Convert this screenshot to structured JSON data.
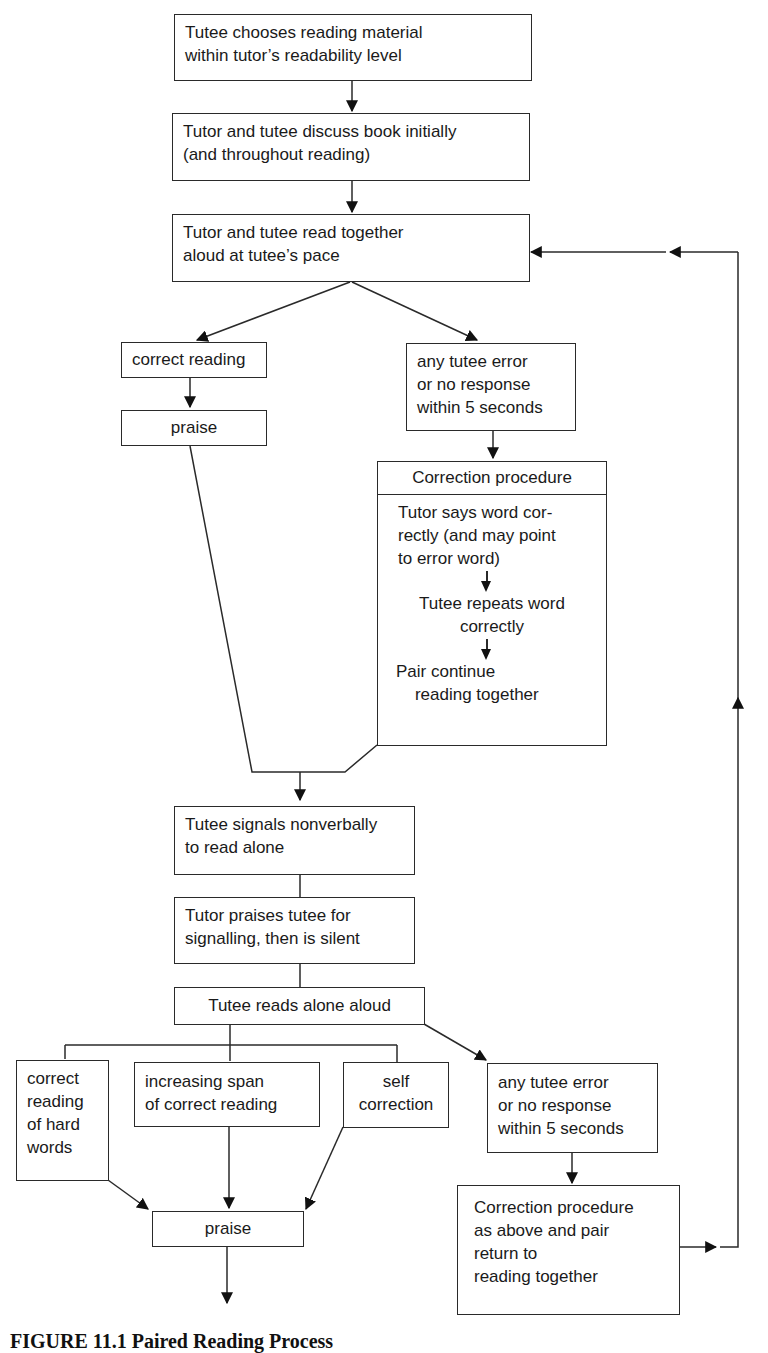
{
  "diagram": {
    "type": "flowchart",
    "nodes": {
      "choose_material": {
        "text": "Tutee chooses reading material\nwithin tutor’s readability level"
      },
      "discuss_book": {
        "text": "Tutor and tutee discuss book initially\n(and throughout reading)"
      },
      "read_together": {
        "text": "Tutor and tutee read together\naloud at tutee’s pace"
      },
      "correct_reading": {
        "text": "correct reading"
      },
      "praise_1": {
        "text": "praise"
      },
      "error_1": {
        "text": "any tutee error\nor no response\nwithin 5 seconds"
      },
      "correction_procedure": {
        "header": "Correction procedure",
        "step_1": "Tutor says word cor-\nrectly (and may point\nto error word)",
        "step_2": "Tutee repeats word\ncorrectly",
        "step_3": "Pair continue\n    reading together"
      },
      "signals_alone": {
        "text": "Tutee signals nonverbally\nto read alone"
      },
      "tutor_praises_silent": {
        "text": "Tutor praises tutee for\nsignalling, then is silent"
      },
      "reads_alone": {
        "text": "Tutee reads alone aloud"
      },
      "hard_words": {
        "text": "correct\nreading\nof hard\nwords"
      },
      "increasing_span": {
        "text": "increasing span\nof correct reading"
      },
      "self_correction": {
        "text": "self\ncorrection"
      },
      "error_2": {
        "text": "any tutee error\nor no response\nwithin 5 seconds"
      },
      "praise_2": {
        "text": "praise"
      },
      "correction_return": {
        "text": "Correction procedure\nas above and pair\nreturn to\nreading together"
      }
    },
    "edges": [
      [
        "choose_material",
        "discuss_book"
      ],
      [
        "discuss_book",
        "read_together"
      ],
      [
        "read_together",
        "correct_reading"
      ],
      [
        "read_together",
        "error_1"
      ],
      [
        "correct_reading",
        "praise_1"
      ],
      [
        "error_1",
        "correction_procedure"
      ],
      [
        "praise_1",
        "signals_alone"
      ],
      [
        "correction_procedure",
        "signals_alone"
      ],
      [
        "signals_alone",
        "tutor_praises_silent"
      ],
      [
        "tutor_praises_silent",
        "reads_alone"
      ],
      [
        "reads_alone",
        "hard_words"
      ],
      [
        "reads_alone",
        "increasing_span"
      ],
      [
        "reads_alone",
        "self_correction"
      ],
      [
        "reads_alone",
        "error_2"
      ],
      [
        "hard_words",
        "praise_2"
      ],
      [
        "increasing_span",
        "praise_2"
      ],
      [
        "self_correction",
        "praise_2"
      ],
      [
        "error_2",
        "correction_return"
      ],
      [
        "correction_return",
        "read_together"
      ]
    ],
    "caption": "FIGURE 11.1   Paired Reading Process"
  }
}
